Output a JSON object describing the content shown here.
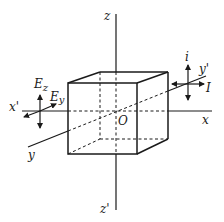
{
  "diagram": {
    "axes": {
      "z_pos": "z",
      "z_neg": "z'",
      "x_pos": "x",
      "x_neg": "x'",
      "y_pos": "y",
      "y_neg": "y'",
      "origin": "O"
    },
    "left_field": {
      "vertical_component": "E",
      "vertical_subscript": "z",
      "diagonal_component": "E",
      "diagonal_subscript": "y"
    },
    "right_indicators": {
      "vertical_label": "i",
      "horizontal_label": "I"
    },
    "colors": {
      "ink": "#1a1a1a",
      "background": "#ffffff"
    }
  }
}
